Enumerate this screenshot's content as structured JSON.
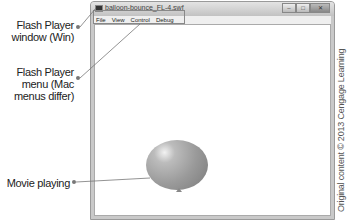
{
  "callouts": [
    {
      "id": "window",
      "lines": [
        "Flash Player",
        "window (Win)"
      ]
    },
    {
      "id": "menu",
      "lines": [
        "Flash Player",
        "menu (Mac",
        "menus differ)"
      ]
    },
    {
      "id": "movie",
      "lines": [
        "Movie playing"
      ]
    }
  ],
  "window": {
    "title": "balloon-bounce_FL-4.swf",
    "controls": {
      "minimize": "–",
      "maximize": "□",
      "close": "✕"
    }
  },
  "menubar": {
    "items": [
      "File",
      "View",
      "Control",
      "Debug"
    ]
  },
  "credit": "Original content © 2013 Cengage Learning"
}
